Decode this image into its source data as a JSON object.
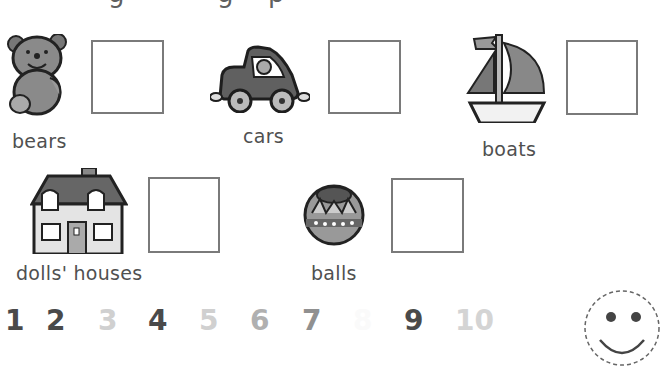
{
  "worksheet": {
    "top_text_clipped": [
      "g",
      "g",
      "p"
    ],
    "items": [
      {
        "label": "bears",
        "icon": "teddy-bear-icon"
      },
      {
        "label": "cars",
        "icon": "toy-car-icon"
      },
      {
        "label": "boats",
        "icon": "sailboat-icon"
      },
      {
        "label": "dolls' houses",
        "icon": "dolls-house-icon"
      },
      {
        "label": "balls",
        "icon": "ball-icon"
      }
    ],
    "number_line": [
      {
        "value": "1",
        "color": "#4a4a4a"
      },
      {
        "value": "2",
        "color": "#4a4a4a"
      },
      {
        "value": "3",
        "color": "#d0d0d0"
      },
      {
        "value": "4",
        "color": "#4a4a4a"
      },
      {
        "value": "5",
        "color": "#d0d0d0"
      },
      {
        "value": "6",
        "color": "#b0b0b0"
      },
      {
        "value": "7",
        "color": "#909090"
      },
      {
        "value": "8",
        "color": "#fafafa"
      },
      {
        "value": "9",
        "color": "#4a4a4a"
      },
      {
        "value": "10",
        "color": "#d4d4d4"
      }
    ],
    "smiley": {
      "icon": "smiley-face-icon"
    }
  }
}
